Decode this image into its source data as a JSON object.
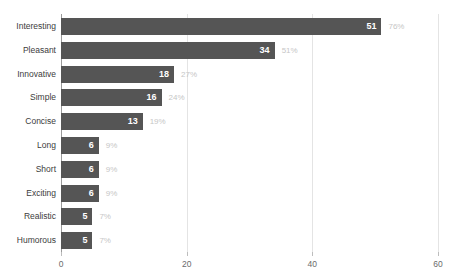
{
  "chart_data": {
    "type": "bar",
    "orientation": "horizontal",
    "title": "",
    "subtitle": "",
    "xlabel": "",
    "ylabel": "",
    "xlim": [
      0,
      60
    ],
    "xticks": [
      0,
      20,
      40,
      60
    ],
    "xtick_labels": [
      "0",
      "20",
      "40",
      "60"
    ],
    "grid": "vertical",
    "legend": "none",
    "categories": [
      "Interesting",
      "Pleasant",
      "Innovative",
      "Simple",
      "Concise",
      "Long",
      "Short",
      "Exciting",
      "Realistic",
      "Humorous"
    ],
    "values": [
      51,
      34,
      18,
      16,
      13,
      6,
      6,
      6,
      5,
      5
    ],
    "value_labels": [
      "51",
      "34",
      "18",
      "16",
      "13",
      "6",
      "6",
      "6",
      "5",
      "5"
    ],
    "percent_labels": [
      "76%",
      "51%",
      "27%",
      "24%",
      "19%",
      "9%",
      "9%",
      "9%",
      "7%",
      "7%"
    ],
    "series": [
      {
        "name": "Count",
        "values": [
          51,
          34,
          18,
          16,
          13,
          6,
          6,
          6,
          5,
          5
        ]
      }
    ],
    "colors": {
      "bar": "#555555",
      "value_label": "#ffffff",
      "percent_label": "#c6c6c6",
      "category_label": "#3c3c3c",
      "tick_label": "#6b6b6b",
      "gridline": "#e4e4e4",
      "zero_axis": "#9a9a9a",
      "background": "#ffffff"
    }
  }
}
